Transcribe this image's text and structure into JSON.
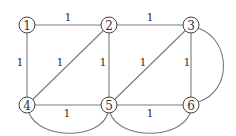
{
  "graph": {
    "nodes": [
      {
        "id": "1",
        "label": "1",
        "x": 27,
        "y": 25
      },
      {
        "id": "2",
        "label": "2",
        "x": 109,
        "y": 25
      },
      {
        "id": "3",
        "label": "3",
        "x": 191,
        "y": 25
      },
      {
        "id": "4",
        "label": "4",
        "x": 27,
        "y": 105
      },
      {
        "id": "5",
        "label": "5",
        "x": 109,
        "y": 105
      },
      {
        "id": "6",
        "label": "6",
        "x": 191,
        "y": 105
      }
    ],
    "edges": [
      {
        "from": "1",
        "to": "2",
        "weight": "1",
        "label_x": 68,
        "label_y": 17
      },
      {
        "from": "2",
        "to": "3",
        "weight": "1",
        "label_x": 150,
        "label_y": 17
      },
      {
        "from": "1",
        "to": "4",
        "weight": "1",
        "label_x": 20,
        "label_y": 62
      },
      {
        "from": "2",
        "to": "4",
        "weight": "1",
        "label_x": 60,
        "label_y": 62
      },
      {
        "from": "2",
        "to": "5",
        "weight": "1",
        "label_x": 103,
        "label_y": 62
      },
      {
        "from": "3",
        "to": "5",
        "weight": "1",
        "label_x": 143,
        "label_y": 62
      },
      {
        "from": "3",
        "to": "6",
        "weight": "1",
        "label_x": 187,
        "label_y": 62
      },
      {
        "from": "4",
        "to": "5",
        "weight": "1",
        "label_x": 67,
        "label_y": 113
      },
      {
        "from": "5",
        "to": "6",
        "weight": "1",
        "label_x": 150,
        "label_y": 113
      },
      {
        "from": "4",
        "to": "5",
        "weight": "",
        "curved": "bottom"
      },
      {
        "from": "5",
        "to": "6",
        "weight": "",
        "curved": "bottom"
      },
      {
        "from": "3",
        "to": "6",
        "weight": "",
        "curved": "right"
      }
    ]
  }
}
